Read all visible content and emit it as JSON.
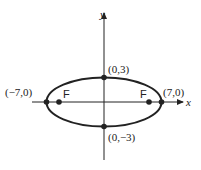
{
  "diagram": {
    "type": "ellipse",
    "axes": {
      "x_label": "x",
      "y_label": "y"
    },
    "vertices": [
      {
        "label": "(−7,0)",
        "x": -7,
        "y": 0
      },
      {
        "label": "(7,0)",
        "x": 7,
        "y": 0
      }
    ],
    "co_vertices": [
      {
        "label": "(0,3)",
        "x": 0,
        "y": 3
      },
      {
        "label": "(0,−3)",
        "x": 0,
        "y": -3
      }
    ],
    "foci": [
      {
        "label": "F",
        "side": "left"
      },
      {
        "label": "F",
        "side": "right"
      }
    ],
    "colors": {
      "stroke": "#222222",
      "background": "#ffffff"
    }
  }
}
